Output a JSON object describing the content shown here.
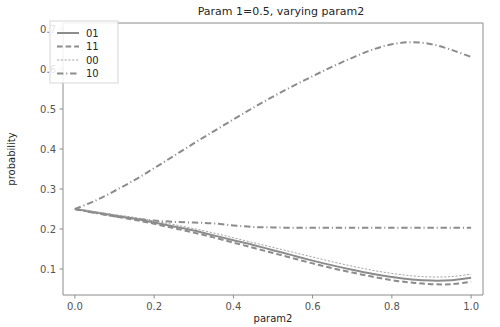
{
  "chart_data": {
    "type": "line",
    "title": "Param 1=0.5, varying param2",
    "xlabel": "param2",
    "ylabel": "probability",
    "xlim": [
      -0.03,
      1.03
    ],
    "ylim": [
      0.035,
      0.715
    ],
    "xticks": [
      0.0,
      0.2,
      0.4,
      0.6,
      0.8,
      1.0
    ],
    "xticklabels": [
      "0.0",
      "0.2",
      "0.4",
      "0.6",
      "0.8",
      "1.0"
    ],
    "yticks": [
      0.1,
      0.2,
      0.3,
      0.4,
      0.5,
      0.6,
      0.7
    ],
    "yticklabels": [
      "0.1",
      "0.2",
      "0.3",
      "0.4",
      "0.5",
      "0.6",
      "0.7"
    ],
    "grid": false,
    "legend_position": "upper left",
    "x": [
      0.0,
      0.05,
      0.1,
      0.15,
      0.2,
      0.25,
      0.3,
      0.35,
      0.4,
      0.45,
      0.5,
      0.55,
      0.6,
      0.65,
      0.7,
      0.75,
      0.8,
      0.85,
      0.9,
      0.95,
      1.0
    ],
    "series": [
      {
        "name": "01",
        "linestyle": "solid",
        "color": "#8c8c8c",
        "values": [
          0.25,
          0.242,
          0.234,
          0.226,
          0.216,
          0.206,
          0.196,
          0.184,
          0.172,
          0.16,
          0.147,
          0.134,
          0.121,
          0.109,
          0.098,
          0.088,
          0.08,
          0.074,
          0.071,
          0.072,
          0.078
        ]
      },
      {
        "name": "11",
        "linestyle": "dashed",
        "color": "#8c8c8c",
        "values": [
          0.25,
          0.241,
          0.232,
          0.223,
          0.213,
          0.202,
          0.191,
          0.179,
          0.166,
          0.153,
          0.14,
          0.127,
          0.114,
          0.102,
          0.091,
          0.081,
          0.072,
          0.066,
          0.062,
          0.062,
          0.068
        ]
      },
      {
        "name": "00",
        "linestyle": "dotted",
        "color": "#a6a6a6",
        "values": [
          0.25,
          0.243,
          0.236,
          0.229,
          0.22,
          0.211,
          0.201,
          0.19,
          0.178,
          0.166,
          0.154,
          0.142,
          0.13,
          0.118,
          0.107,
          0.097,
          0.089,
          0.083,
          0.08,
          0.081,
          0.087
        ]
      },
      {
        "name": "10",
        "linestyle": "dashdot",
        "color": "#8c8c8c",
        "values": [
          0.25,
          0.24,
          0.232,
          0.226,
          0.221,
          0.218,
          0.216,
          0.214,
          0.209,
          0.205,
          0.204,
          0.203,
          0.203,
          0.203,
          0.203,
          0.203,
          0.203,
          0.203,
          0.203,
          0.203,
          0.203
        ]
      },
      {
        "name": "10-upper",
        "linestyle": "dashdot",
        "color": "#8c8c8c",
        "values": [
          0.25,
          0.27,
          0.295,
          0.322,
          0.352,
          0.383,
          0.414,
          0.444,
          0.474,
          0.503,
          0.531,
          0.557,
          0.582,
          0.606,
          0.628,
          0.648,
          0.662,
          0.667,
          0.662,
          0.648,
          0.63
        ]
      }
    ],
    "legend": [
      {
        "label": "01",
        "linestyle": "solid"
      },
      {
        "label": "11",
        "linestyle": "dashed"
      },
      {
        "label": "00",
        "linestyle": "dotted"
      },
      {
        "label": "10",
        "linestyle": "dashdot"
      }
    ]
  }
}
